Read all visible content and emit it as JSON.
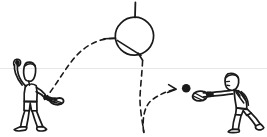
{
  "image": {
    "title": "Tennis serve trajectory sketch",
    "medium": "hand-drawn ink line drawing",
    "background_color": "#ffffff",
    "ink_color": "#1a1a1a",
    "faint_rule_color": "#e8e8e8",
    "width": 267,
    "height": 137
  },
  "scene": {
    "description": "Two stick-style human figures with rackets; a dashed ball trajectory arcs from the left server up through a circle, descends, bounces off the ground, and travels toward the receiver on the right where a solid ball is drawn.",
    "elements": [
      {
        "name": "server-figure",
        "label": "Server (left player)",
        "pose": "standing, left arm raised overhead tossing the ball, racket held low across the body to the right",
        "position": "left",
        "bbox": [
          8,
          58,
          62,
          130
        ]
      },
      {
        "name": "receiver-figure",
        "label": "Receiver (right player)",
        "pose": "crouched and leaning forward, both arms extended left holding racket low, legs in a wide split stance",
        "position": "right",
        "bbox": [
          190,
          72,
          262,
          132
        ]
      },
      {
        "name": "target-circle",
        "label": "Contact zone circle",
        "shape": "circle with vertical stub line at top, short horizontal stub at left, and an internal diagonal chord",
        "center": [
          134,
          36
        ],
        "radius": 19
      },
      {
        "name": "ball",
        "label": "Ball",
        "shape": "solid filled dot",
        "center": [
          186,
          88
        ],
        "radius": 4
      },
      {
        "name": "rising-trajectory",
        "label": "Toss / rising ball path",
        "style": "dashed arc",
        "from": "server racket area",
        "to": "target circle (left side)"
      },
      {
        "name": "descending-trajectory",
        "label": "Descending ball path",
        "style": "dashed near-vertical line",
        "from": "target circle (bottom)",
        "to": "ground bounce point"
      },
      {
        "name": "bounce-trajectory",
        "label": "Post-bounce ball path with arrowhead",
        "style": "dashed rising curve terminating in an arrowhead",
        "from": "ground bounce point",
        "to": "ball"
      },
      {
        "name": "ground-line",
        "label": "Faint horizontal ground rule",
        "style": "very light horizontal line",
        "y": 68
      }
    ]
  },
  "annotations": {
    "text_labels": [],
    "note": "No text, numbers, or captions appear anywhere in this image."
  }
}
